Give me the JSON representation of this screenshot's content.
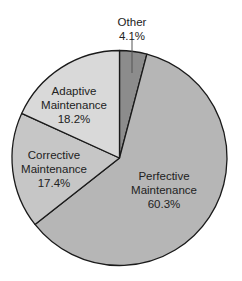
{
  "chart_data": {
    "type": "pie",
    "title": "",
    "start_angle_deg": 0,
    "direction": "clockwise",
    "slices": [
      {
        "name": "Other",
        "label_line1": "Other",
        "label_line2": "",
        "value": 4.1,
        "value_label": "4.1%",
        "color": "#8c8c8c"
      },
      {
        "name": "Perfective Maintenance",
        "label_line1": "Perfective",
        "label_line2": "Maintenance",
        "value": 60.3,
        "value_label": "60.3%",
        "color": "#b6b6b6"
      },
      {
        "name": "Corrective Maintenance",
        "label_line1": "Corrective",
        "label_line2": "Maintenance",
        "value": 17.4,
        "value_label": "17.4%",
        "color": "#c6c6c6"
      },
      {
        "name": "Adaptive Maintenance",
        "label_line1": "Adaptive",
        "label_line2": "Maintenance",
        "value": 18.2,
        "value_label": "18.2%",
        "color": "#d9d9d9"
      }
    ],
    "categories": [
      "Other",
      "Perfective Maintenance",
      "Corrective Maintenance",
      "Adaptive Maintenance"
    ],
    "values": [
      4.1,
      60.3,
      17.4,
      18.2
    ],
    "legend": "none (labels placed on/near slices)",
    "outline_color": "#1a1a1a"
  },
  "labels": {
    "other": {
      "line1": "Other",
      "line2": "4.1%"
    },
    "perfective": {
      "line1": "Perfective",
      "line2": "Maintenance",
      "line3": "60.3%"
    },
    "corrective": {
      "line1": "Corrective",
      "line2": "Maintenance",
      "line3": "17.4%"
    },
    "adaptive": {
      "line1": "Adaptive",
      "line2": "Maintenance",
      "line3": "18.2%"
    }
  }
}
